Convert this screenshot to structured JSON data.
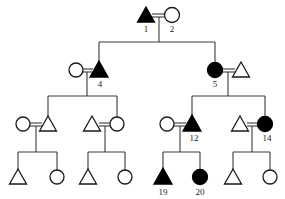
{
  "figure": {
    "kind": "pedigree-chart",
    "background_color": "#ffffff",
    "line_color": "#3a3a3a",
    "symbol_outline_color": "#1a1a1a",
    "affected_fill_color": "#000000",
    "unaffected_fill_color": "#ffffff",
    "width": 285,
    "height": 199
  },
  "legend_implied": {
    "triangle": "male",
    "circle": "female",
    "filled": "affected",
    "open": "unaffected"
  },
  "generations": [
    {
      "name": "generation-1",
      "y": 15,
      "individuals": [
        {
          "id": "i1",
          "label": "1",
          "shape": "triangle",
          "status": "filled",
          "x": 146,
          "y": 15
        },
        {
          "id": "i2",
          "label": "2",
          "shape": "circle",
          "status": "open",
          "x": 172,
          "y": 15
        }
      ]
    },
    {
      "name": "generation-2",
      "y": 70,
      "individuals": [
        {
          "id": "i3",
          "label": "",
          "shape": "circle",
          "status": "open",
          "x": 76,
          "y": 70
        },
        {
          "id": "i4",
          "label": "4",
          "shape": "triangle",
          "status": "filled",
          "x": 99,
          "y": 70
        },
        {
          "id": "i5",
          "label": "5",
          "shape": "circle",
          "status": "filled",
          "x": 215,
          "y": 70
        },
        {
          "id": "i6",
          "label": "",
          "shape": "triangle",
          "status": "open",
          "x": 241,
          "y": 70
        }
      ]
    },
    {
      "name": "generation-3",
      "y": 124,
      "individuals": [
        {
          "id": "i7",
          "label": "",
          "shape": "circle",
          "status": "open",
          "x": 23,
          "y": 124
        },
        {
          "id": "i8",
          "label": "",
          "shape": "triangle",
          "status": "open",
          "x": 48,
          "y": 124
        },
        {
          "id": "i9",
          "label": "",
          "shape": "triangle",
          "status": "open",
          "x": 92,
          "y": 124
        },
        {
          "id": "i10",
          "label": "",
          "shape": "circle",
          "status": "open",
          "x": 117,
          "y": 124
        },
        {
          "id": "i11",
          "label": "",
          "shape": "circle",
          "status": "open",
          "x": 167,
          "y": 124
        },
        {
          "id": "i12",
          "label": "12",
          "shape": "triangle",
          "status": "filled",
          "x": 192,
          "y": 124
        },
        {
          "id": "i13",
          "label": "",
          "shape": "triangle",
          "status": "open",
          "x": 240,
          "y": 124
        },
        {
          "id": "i14",
          "label": "14",
          "shape": "circle",
          "status": "filled",
          "x": 265,
          "y": 124
        }
      ]
    },
    {
      "name": "generation-4",
      "y": 177,
      "individuals": [
        {
          "id": "i15",
          "label": "",
          "shape": "triangle",
          "status": "open",
          "x": 18,
          "y": 177
        },
        {
          "id": "i16",
          "label": "",
          "shape": "circle",
          "status": "open",
          "x": 57,
          "y": 177
        },
        {
          "id": "i17",
          "label": "",
          "shape": "triangle",
          "status": "open",
          "x": 88,
          "y": 177
        },
        {
          "id": "i18",
          "label": "",
          "shape": "circle",
          "status": "open",
          "x": 125,
          "y": 177
        },
        {
          "id": "i19",
          "label": "19",
          "shape": "triangle",
          "status": "filled",
          "x": 163,
          "y": 177
        },
        {
          "id": "i20",
          "label": "20",
          "shape": "circle",
          "status": "filled",
          "x": 200,
          "y": 177
        },
        {
          "id": "i21",
          "label": "",
          "shape": "triangle",
          "status": "open",
          "x": 233,
          "y": 177
        },
        {
          "id": "i22",
          "label": "",
          "shape": "circle",
          "status": "open",
          "x": 270,
          "y": 177
        }
      ]
    }
  ],
  "labels": [
    {
      "text": "1",
      "x": 146,
      "y": 31
    },
    {
      "text": "2",
      "x": 172,
      "y": 31
    },
    {
      "text": "4",
      "x": 100,
      "y": 86
    },
    {
      "text": "5",
      "x": 215,
      "y": 86
    },
    {
      "text": "12",
      "x": 194,
      "y": 140
    },
    {
      "text": "14",
      "x": 267,
      "y": 140
    },
    {
      "text": "19",
      "x": 163,
      "y": 194
    },
    {
      "text": "20",
      "x": 200,
      "y": 194
    }
  ],
  "unions": [
    {
      "name": "union-1x2",
      "left_x": 146,
      "right_x": 172,
      "y": 15,
      "drop_x": 159,
      "drop_to": 42
    },
    {
      "name": "union-3x4",
      "left_x": 76,
      "right_x": 99,
      "y": 70,
      "drop_x": 87,
      "drop_to": 96
    },
    {
      "name": "union-5x6",
      "left_x": 215,
      "right_x": 241,
      "y": 70,
      "drop_x": 228,
      "drop_to": 96
    },
    {
      "name": "union-7x8",
      "left_x": 23,
      "right_x": 48,
      "y": 124,
      "drop_x": 36,
      "drop_to": 152
    },
    {
      "name": "union-9x10",
      "left_x": 92,
      "right_x": 117,
      "y": 124,
      "drop_x": 105,
      "drop_to": 152
    },
    {
      "name": "union-11x12",
      "left_x": 167,
      "right_x": 192,
      "y": 124,
      "drop_x": 180,
      "drop_to": 152
    },
    {
      "name": "union-13x14",
      "left_x": 240,
      "right_x": 265,
      "y": 124,
      "drop_x": 252,
      "drop_to": 152
    }
  ],
  "sibships": [
    {
      "name": "sibship-gen2",
      "bar_y": 42,
      "left_x": 99,
      "right_x": 215,
      "children_x": [
        99,
        215
      ],
      "child_top": 62
    },
    {
      "name": "sibship-gen3-left",
      "bar_y": 96,
      "left_x": 48,
      "right_x": 117,
      "children_x": [
        48,
        117
      ],
      "child_top": 116
    },
    {
      "name": "sibship-gen3-right",
      "bar_y": 96,
      "left_x": 192,
      "right_x": 265,
      "children_x": [
        192,
        265
      ],
      "child_top": 116
    },
    {
      "name": "sibship-gen4-a",
      "bar_y": 152,
      "left_x": 18,
      "right_x": 57,
      "children_x": [
        18,
        57
      ],
      "child_top": 169
    },
    {
      "name": "sibship-gen4-b",
      "bar_y": 152,
      "left_x": 88,
      "right_x": 125,
      "children_x": [
        88,
        125
      ],
      "child_top": 169
    },
    {
      "name": "sibship-gen4-c",
      "bar_y": 152,
      "left_x": 163,
      "right_x": 200,
      "children_x": [
        163,
        200
      ],
      "child_top": 169
    },
    {
      "name": "sibship-gen4-d",
      "bar_y": 152,
      "left_x": 233,
      "right_x": 270,
      "children_x": [
        233,
        270
      ],
      "child_top": 169
    }
  ]
}
